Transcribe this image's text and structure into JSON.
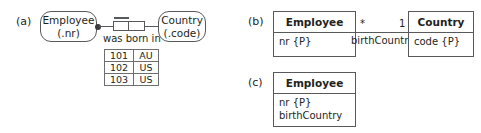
{
  "parts": {
    "a": "(a)",
    "b": "(b)",
    "c": "(c)"
  },
  "orm": {
    "entity_employee": {
      "name": "Employee",
      "reference_mode": "(.nr)"
    },
    "entity_country": {
      "name": "Country",
      "reference_mode": "(.code)"
    },
    "predicate": "was born in",
    "population": {
      "columns": [
        "nr",
        "code"
      ],
      "rows": [
        [
          "101",
          "AU"
        ],
        [
          "102",
          "US"
        ],
        [
          "103",
          "US"
        ]
      ]
    }
  },
  "uml_b": {
    "class_employee": {
      "name": "Employee",
      "attributes": [
        "nr {P}"
      ]
    },
    "class_country": {
      "name": "Country",
      "attributes": [
        "code {P}"
      ]
    },
    "association": {
      "source_multiplicity": "*",
      "target_multiplicity": "1",
      "role_name": "birthCountry"
    }
  },
  "uml_c": {
    "class_employee": {
      "name": "Employee",
      "attributes": [
        "nr {P}",
        "birthCountry"
      ]
    }
  },
  "colors": {
    "stroke": "#58595b",
    "text": "#231f20",
    "background": "#ffffff"
  }
}
